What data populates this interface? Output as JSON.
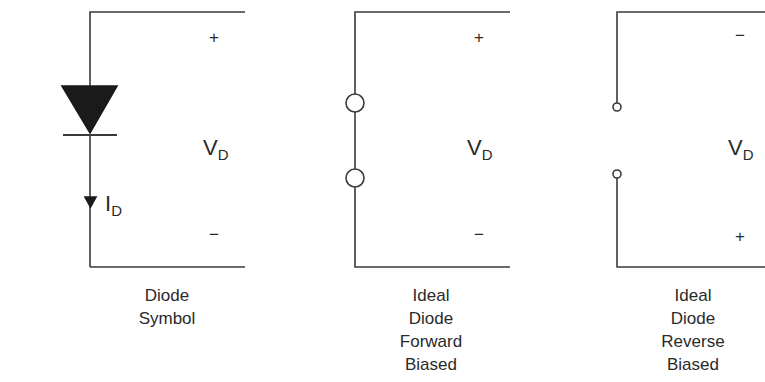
{
  "panels": [
    {
      "id": "diode-symbol",
      "top_sign": "+",
      "bottom_sign": "−",
      "voltage_label": {
        "main": "V",
        "sub": "D"
      },
      "current_label": {
        "main": "I",
        "sub": "D"
      },
      "caption": [
        "Diode",
        "Symbol"
      ]
    },
    {
      "id": "ideal-forward",
      "top_sign": "+",
      "bottom_sign": "−",
      "voltage_label": {
        "main": "V",
        "sub": "D"
      },
      "caption": [
        "Ideal",
        "Diode",
        "Forward",
        "Biased"
      ]
    },
    {
      "id": "ideal-reverse",
      "top_sign": "−",
      "bottom_sign": "+",
      "voltage_label": {
        "main": "V",
        "sub": "D"
      },
      "caption": [
        "Ideal",
        "Diode",
        "Reverse",
        "Biased"
      ]
    }
  ],
  "colors": {
    "line": "#3a3a3a",
    "fill": "#1a1a1a",
    "background": "#ffffff"
  }
}
